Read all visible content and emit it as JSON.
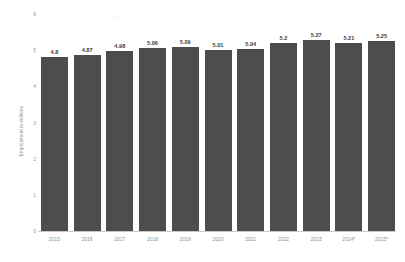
{
  "chart_data": {
    "type": "bar",
    "title": "",
    "subtitle": "",
    "xlabel": "",
    "ylabel": "Employment in millions",
    "categories": [
      "2015",
      "2016",
      "2017",
      "2018",
      "2019",
      "2020",
      "2021",
      "2022",
      "2023",
      "2024*",
      "2025*"
    ],
    "values": [
      4.8,
      4.87,
      4.98,
      5.06,
      5.09,
      5.01,
      5.04,
      5.2,
      5.27,
      5.21,
      5.25
    ],
    "value_labels": [
      "4.8",
      "4.87",
      "4.98",
      "5.06",
      "5.09",
      "5.01",
      "5.04",
      "5.2",
      "5.27",
      "5.21",
      "5.25"
    ],
    "ylim": [
      0,
      6
    ],
    "yticks": [
      0,
      1,
      2,
      3,
      4,
      5,
      6
    ],
    "ytick_labels": [
      "0",
      "1",
      "2",
      "3",
      "4",
      "5",
      "6"
    ],
    "grid": false,
    "legend": null,
    "bar_color": "#4d4d4d",
    "axis_color": "#c9c9c9",
    "tick_label_color": "#8f8f8f",
    "value_label_color": "#3b3b3b"
  },
  "watermark": {
    "text": "Statista"
  }
}
